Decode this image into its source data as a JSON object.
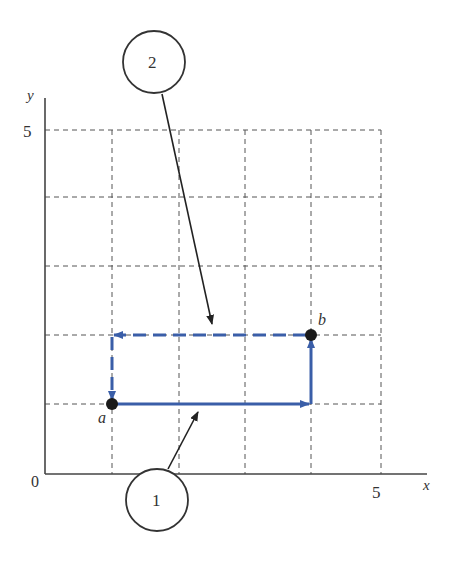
{
  "diagram": {
    "axes": {
      "x_label": "x",
      "y_label": "y",
      "origin_label": "0",
      "x_tick_label": "5",
      "y_tick_label": "5",
      "x_range": [
        0,
        5
      ],
      "y_range": [
        0,
        5
      ],
      "grid": true
    },
    "points": [
      {
        "id": "a",
        "label": "a",
        "x": 1,
        "y": 1
      },
      {
        "id": "b",
        "label": "b",
        "x": 4,
        "y": 2
      }
    ],
    "paths": [
      {
        "id": "path-1",
        "label": "1",
        "style": "solid",
        "color": "#3a5ea8",
        "waypoints": [
          [
            1,
            1
          ],
          [
            4,
            1
          ],
          [
            4,
            2
          ]
        ]
      },
      {
        "id": "path-2",
        "label": "2",
        "style": "dashed",
        "color": "#3a5ea8",
        "waypoints": [
          [
            4,
            2
          ],
          [
            1,
            2
          ],
          [
            1,
            1
          ]
        ]
      }
    ],
    "callouts": [
      {
        "label": "2",
        "points_to": "path-2"
      },
      {
        "label": "1",
        "points_to": "path-1"
      }
    ]
  }
}
